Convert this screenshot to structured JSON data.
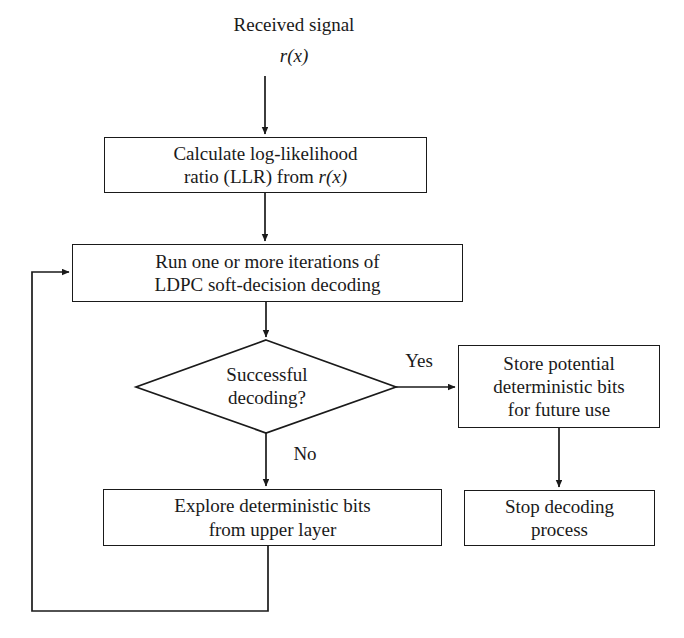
{
  "diagram": {
    "title_top": "Received signal",
    "title_top_math": "r(x)",
    "background_color": "#ffffff",
    "stroke_color": "#1a1a1a",
    "nodes": {
      "calculate_llr": {
        "shape": "process",
        "line1": "Calculate log-likelihood",
        "line2_pre": "ratio (LLR) from ",
        "line2_math": "r(x)"
      },
      "run_iterations": {
        "shape": "process",
        "line1": "Run one or more iterations of",
        "line2": "LDPC soft-decision decoding"
      },
      "decision": {
        "shape": "diamond",
        "line1": "Successful",
        "line2": "decoding?"
      },
      "store_bits": {
        "shape": "process",
        "line1": "Store potential",
        "line2": "deterministic bits",
        "line3": "for future use"
      },
      "explore_bits": {
        "shape": "process",
        "line1": "Explore deterministic bits",
        "line2": "from upper layer"
      },
      "stop_decoding": {
        "shape": "process",
        "line1": "Stop decoding",
        "line2": "process"
      }
    },
    "edge_labels": {
      "yes": "Yes",
      "no": "No"
    }
  }
}
